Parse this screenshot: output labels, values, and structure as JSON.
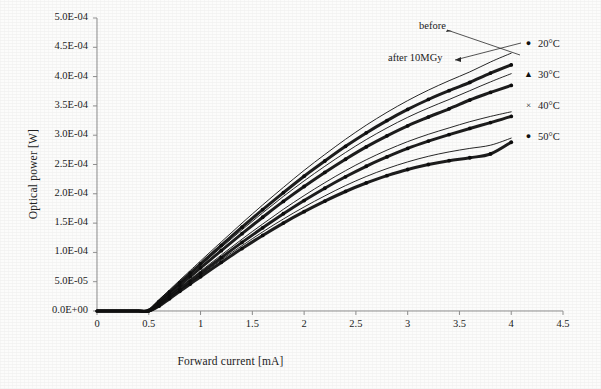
{
  "chart_data": {
    "type": "line",
    "title": "",
    "xlabel": "Forward current [mA]",
    "ylabel": "Optical power [W]",
    "xlim": [
      0,
      4.5
    ],
    "ylim": [
      0,
      0.0005
    ],
    "xticks": [
      "0",
      "0.5",
      "1",
      "1.5",
      "2",
      "2.5",
      "3",
      "3.5",
      "4",
      "4.5"
    ],
    "xtick_values": [
      0,
      0.5,
      1,
      1.5,
      2,
      2.5,
      3,
      3.5,
      4,
      4.5
    ],
    "yticks": [
      "0.0E+00",
      "5.0E-05",
      "1.0E-04",
      "1.5E-04",
      "2.0E-04",
      "2.5E-04",
      "3.0E-04",
      "3.5E-04",
      "4.0E-04",
      "4.5E-04",
      "5.0E-04"
    ],
    "ytick_values": [
      0,
      5e-05,
      0.0001,
      0.00015,
      0.0002,
      0.00025,
      0.0003,
      0.00035,
      0.0004,
      0.00045,
      0.0005
    ],
    "grid": false,
    "legend_position": "right",
    "x": [
      0,
      0.1,
      0.2,
      0.3,
      0.4,
      0.5,
      0.6,
      0.7,
      0.8,
      0.9,
      1.0,
      1.2,
      1.4,
      1.6,
      1.8,
      2.0,
      2.2,
      2.4,
      2.6,
      2.8,
      3.0,
      3.2,
      3.4,
      3.6,
      3.8,
      4.0
    ],
    "series": [
      {
        "name": "20°C before",
        "temperature": "20°C",
        "condition": "before",
        "marker": "dot",
        "values": [
          0,
          0,
          0,
          0,
          0,
          3e-06,
          1.95e-05,
          3.6e-05,
          5.25e-05,
          6.9e-05,
          8.55e-05,
          0.000118,
          0.00015,
          0.000181,
          0.000211,
          0.00024,
          0.000267,
          0.000293,
          0.000317,
          0.000339,
          0.000359,
          0.000377,
          0.000393,
          0.000408,
          0.000425,
          0.00044
        ]
      },
      {
        "name": "20°C after 10MGy",
        "temperature": "20°C",
        "condition": "after 10MGy",
        "marker": "dot",
        "values": [
          0,
          0,
          0,
          0,
          0,
          1e-06,
          1.65e-05,
          3.25e-05,
          4.85e-05,
          6.45e-05,
          8.05e-05,
          0.000112,
          0.000143,
          0.000173,
          0.000202,
          0.00023,
          0.000256,
          0.000281,
          0.000304,
          0.000325,
          0.000344,
          0.000361,
          0.000376,
          0.00039,
          0.000406,
          0.00042
        ]
      },
      {
        "name": "30°C before",
        "temperature": "30°C",
        "condition": "before",
        "marker": "triangle",
        "values": [
          0,
          0,
          0,
          0,
          0,
          1e-06,
          1.6e-05,
          3.15e-05,
          4.7e-05,
          6.25e-05,
          7.8e-05,
          0.0001085,
          0.0001385,
          0.0001675,
          0.0001955,
          0.000222,
          0.000247,
          0.0002705,
          0.0002925,
          0.0003125,
          0.0003305,
          0.0003465,
          0.000361,
          0.000376,
          0.000391,
          0.000405
        ]
      },
      {
        "name": "30°C after 10MGy",
        "temperature": "30°C",
        "condition": "after 10MGy",
        "marker": "triangle",
        "values": [
          0,
          0,
          0,
          0,
          0,
          0,
          1.35e-05,
          2.85e-05,
          4.35e-05,
          5.85e-05,
          7.35e-05,
          0.000103,
          0.000132,
          0.00016,
          0.000187,
          0.0002125,
          0.0002365,
          0.000259,
          0.00028,
          0.000299,
          0.000316,
          0.000331,
          0.000345,
          0.00036,
          0.000373,
          0.000385
        ]
      },
      {
        "name": "40°C before",
        "temperature": "40°C",
        "condition": "before",
        "marker": "x",
        "values": [
          0,
          0,
          0,
          0,
          0,
          0,
          1.2e-05,
          2.6e-05,
          4e-05,
          5.4e-05,
          6.8e-05,
          9.55e-05,
          0.0001225,
          0.0001485,
          0.0001735,
          0.000197,
          0.000219,
          0.0002395,
          0.000258,
          0.0002745,
          0.000289,
          0.0003015,
          0.0003125,
          0.000323,
          0.000332,
          0.00034
        ]
      },
      {
        "name": "40°C after 10MGy",
        "temperature": "40°C",
        "condition": "after 10MGy",
        "marker": "x",
        "values": [
          0,
          0,
          0,
          0,
          0,
          0,
          1.05e-05,
          2.4e-05,
          3.75e-05,
          5.1e-05,
          6.45e-05,
          9.1e-05,
          0.000117,
          0.000142,
          0.000166,
          0.0001885,
          0.0002095,
          0.000229,
          0.000247,
          0.000263,
          0.0002775,
          0.00029,
          0.000301,
          0.0003115,
          0.0003215,
          0.000332
        ]
      },
      {
        "name": "50°C before",
        "temperature": "50°C",
        "condition": "before",
        "marker": "dot",
        "values": [
          0,
          0,
          0,
          0,
          0,
          0,
          9.5e-06,
          2.25e-05,
          3.55e-05,
          4.85e-05,
          6.15e-05,
          8.7e-05,
          0.0001115,
          0.000135,
          0.000157,
          0.0001775,
          0.0001965,
          0.000214,
          0.0002295,
          0.000243,
          0.0002545,
          0.000264,
          0.0002715,
          0.0002775,
          0.000283,
          0.000295
        ]
      },
      {
        "name": "50°C after 10MGy",
        "temperature": "50°C",
        "condition": "after 10MGy",
        "marker": "dot",
        "values": [
          0,
          0,
          0,
          0,
          0,
          0,
          8.5e-06,
          2.1e-05,
          3.35e-05,
          4.6e-05,
          5.85e-05,
          8.3e-05,
          0.0001065,
          0.000129,
          0.00015,
          0.0001695,
          0.0001875,
          0.000204,
          0.0002185,
          0.000231,
          0.0002415,
          0.00025,
          0.0002565,
          0.0002615,
          0.000268,
          0.000288
        ]
      }
    ],
    "annotations": [
      {
        "id": "before",
        "text": "before",
        "x_px": 419,
        "y_px": 27
      },
      {
        "id": "after",
        "text": "after 10MGy",
        "x_px": 388,
        "y_px": 59
      }
    ],
    "legend_entries": [
      {
        "label": "20°C",
        "marker": "dot"
      },
      {
        "label": "30°C",
        "marker": "triangle"
      },
      {
        "label": "40°C",
        "marker": "x"
      },
      {
        "label": "50°C",
        "marker": "dot"
      }
    ],
    "colors": {
      "curve": "#111111",
      "axis": "#8a8a8a",
      "text": "#1a1a1a"
    }
  }
}
